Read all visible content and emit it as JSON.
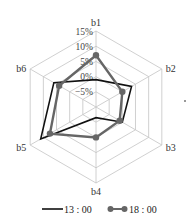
{
  "chart_data": {
    "type": "radar",
    "title": "",
    "axes": [
      "b1",
      "b2",
      "b3",
      "b4",
      "b5",
      "b6"
    ],
    "rings": [
      -10,
      -5,
      0,
      5,
      10,
      15
    ],
    "ring_labels": [
      "15%",
      "10%",
      "5%",
      "0%",
      "−5%"
    ],
    "range": [
      -10,
      15
    ],
    "series": [
      {
        "name": "13 : 00",
        "color": "#111111",
        "marker": "none",
        "values": [
          -1,
          3.5,
          0,
          -6.5,
          11,
          6
        ]
      },
      {
        "name": "18 : 00",
        "color": "#666666",
        "marker": "circle",
        "values": [
          7,
          0,
          -1,
          0,
          7.5,
          4
        ]
      }
    ],
    "legend_position": "bottom",
    "grid": true
  },
  "legend": {
    "items": [
      {
        "label": "13 : 00"
      },
      {
        "label": "18 : 00"
      }
    ]
  }
}
